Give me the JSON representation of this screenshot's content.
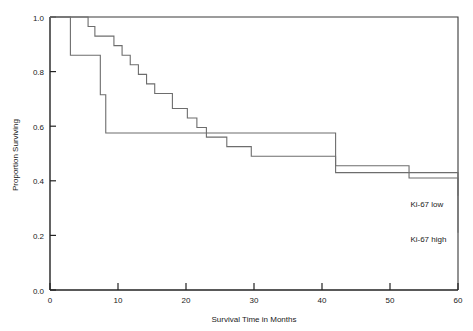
{
  "chart_data": {
    "type": "line",
    "subtype": "kaplan-meier-step",
    "title": "",
    "xlabel": "Survival Time in Months",
    "ylabel": "Proportion Surviving",
    "xlim": [
      0,
      60
    ],
    "ylim": [
      0.0,
      1.0
    ],
    "xticks": [
      0,
      10,
      20,
      30,
      40,
      50,
      60
    ],
    "xtick_labels": [
      "0",
      "10",
      "20",
      "30",
      "40",
      "50",
      "60"
    ],
    "yticks": [
      0.0,
      0.2,
      0.4,
      0.6,
      0.8,
      1.0
    ],
    "ytick_labels": [
      "0.0",
      "0.2",
      "0.4",
      "0.6",
      "0.8",
      "1.0"
    ],
    "grid": false,
    "legend_position": "inline-right-annotation",
    "frame": "box",
    "line_color": "#6d6d6d",
    "axis_color": "#222222",
    "series": [
      {
        "name": "Ki-67 low",
        "label": "Ki-67 low",
        "label_x": 53.0,
        "label_y": 0.305,
        "x": [
          0,
          4.2,
          5.6,
          6.6,
          8.0,
          9.4,
          10.6,
          11.8,
          13.0,
          14.2,
          15.4,
          16.6,
          18.0,
          20.2,
          21.6,
          23.0,
          24.4,
          26.0,
          29.6,
          42.0,
          47.8,
          52.8,
          60.0
        ],
        "y": [
          1.0,
          1.0,
          0.965,
          0.93,
          0.93,
          0.895,
          0.86,
          0.825,
          0.79,
          0.755,
          0.72,
          0.72,
          0.665,
          0.63,
          0.595,
          0.56,
          0.56,
          0.525,
          0.49,
          0.455,
          0.455,
          0.41,
          0.345
        ],
        "steps": [
          {
            "time": 5.6,
            "survival": 0.965
          },
          {
            "time": 6.6,
            "survival": 0.93
          },
          {
            "time": 9.4,
            "survival": 0.895
          },
          {
            "time": 10.6,
            "survival": 0.86
          },
          {
            "time": 11.8,
            "survival": 0.825
          },
          {
            "time": 13.0,
            "survival": 0.79
          },
          {
            "time": 14.2,
            "survival": 0.755
          },
          {
            "time": 15.4,
            "survival": 0.72
          },
          {
            "time": 18.0,
            "survival": 0.665
          },
          {
            "time": 20.2,
            "survival": 0.63
          },
          {
            "time": 21.6,
            "survival": 0.595
          },
          {
            "time": 23.0,
            "survival": 0.56
          },
          {
            "time": 26.0,
            "survival": 0.525
          },
          {
            "time": 29.6,
            "survival": 0.49
          },
          {
            "time": 42.0,
            "survival": 0.455
          },
          {
            "time": 47.8,
            "survival": 0.41
          },
          {
            "time": 52.8,
            "survival": 0.345
          }
        ],
        "final_survival": 0.345
      },
      {
        "name": "Ki-67 high",
        "label": "Ki-67 high",
        "label_x": 53.0,
        "label_y": 0.175,
        "x": [
          0,
          3.0,
          3.0,
          6.0,
          7.4,
          8.2,
          42.0,
          60.0
        ],
        "y": [
          1.0,
          1.0,
          0.86,
          0.86,
          0.715,
          0.575,
          0.43,
          0.21
        ],
        "steps": [
          {
            "time": 3.0,
            "survival": 0.86
          },
          {
            "time": 6.0,
            "survival": 0.715
          },
          {
            "time": 7.4,
            "survival": 0.575
          },
          {
            "time": 8.2,
            "survival": 0.43
          },
          {
            "time": 42.0,
            "survival": 0.21
          }
        ],
        "final_survival": 0.21
      }
    ]
  }
}
